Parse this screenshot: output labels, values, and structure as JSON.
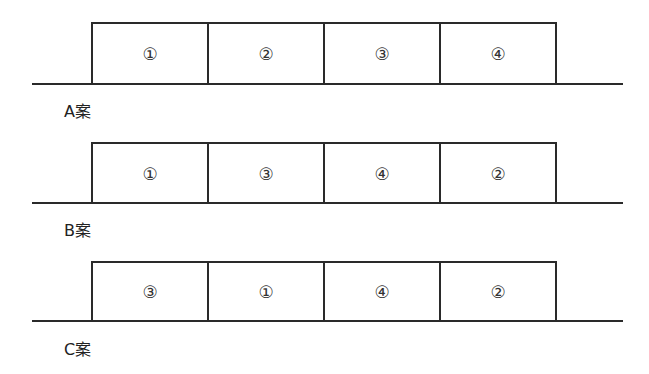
{
  "plans": [
    {
      "label": "A案",
      "segments": [
        "①",
        "②",
        "③",
        "④"
      ]
    },
    {
      "label": "B案",
      "segments": [
        "①",
        "③",
        "④",
        "②"
      ]
    },
    {
      "label": "C案",
      "segments": [
        "③",
        "①",
        "④",
        "②"
      ]
    }
  ]
}
